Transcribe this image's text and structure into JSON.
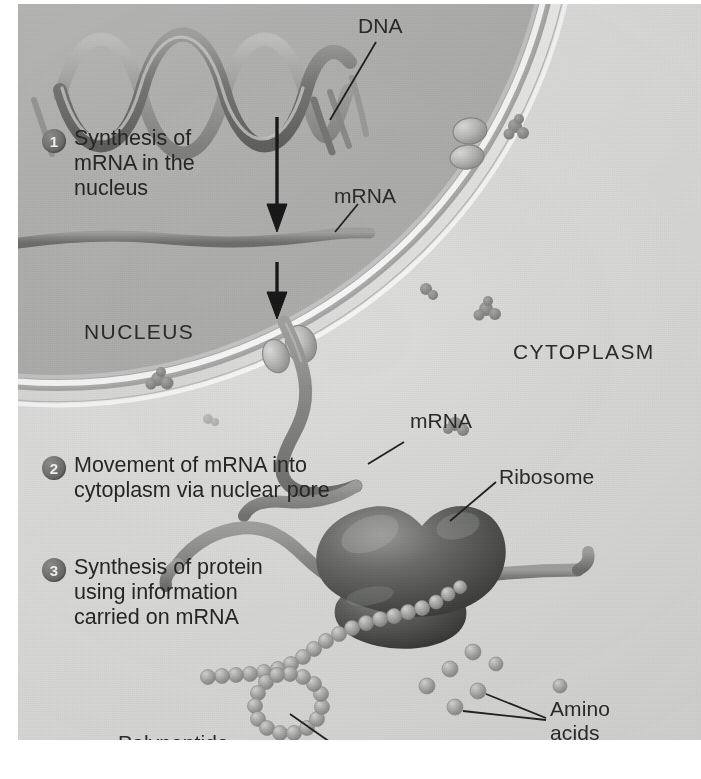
{
  "figure": {
    "background_color": "#d7d8d6",
    "ink_color": "#2a2a2a"
  },
  "regions": [
    {
      "id": "nucleus",
      "label": "NUCLEUS"
    },
    {
      "id": "cytoplasm",
      "label": "CYTOPLASM"
    }
  ],
  "steps": [
    {
      "number": "1",
      "text": "Synthesis of\nmRNA in the\nnucleus"
    },
    {
      "number": "2",
      "text": "Movement of\nmRNA into cytoplasm\nvia nuclear pore"
    },
    {
      "number": "3",
      "text": "Synthesis of\nprotein using\ninformation\ncarried on\nmRNA"
    }
  ],
  "callouts": [
    {
      "id": "dna",
      "label": "DNA"
    },
    {
      "id": "mrna-nuclear",
      "label": "mRNA"
    },
    {
      "id": "mrna-cyto",
      "label": "mRNA"
    },
    {
      "id": "ribosome",
      "label": "Ribosome"
    },
    {
      "id": "amino-acids",
      "label": "Amino\nacids"
    },
    {
      "id": "polypeptide",
      "label": "Polypeptide"
    }
  ],
  "structures": {
    "dna_helix": {
      "name": "DNA double helix ribbon",
      "turns": 4
    },
    "nuclear_envelope": {
      "name": "nuclear envelope double membrane"
    },
    "nuclear_pore": {
      "name": "nuclear pore",
      "count": 2
    },
    "chromatin": {
      "name": "chromatin speck",
      "count": 6
    },
    "mrna_strand": {
      "name": "mRNA ribbon"
    },
    "ribosome": {
      "name": "ribosome large and small subunit"
    },
    "polypeptide": {
      "name": "polypeptide bead chain",
      "bead_count": 34
    },
    "amino_acids": {
      "name": "free amino acid sphere",
      "count": 7
    },
    "arrows": {
      "name": "downward process arrow",
      "count": 2
    }
  },
  "colors": {
    "plate": "#d7d8d6",
    "nucleus_fill": "#b9bab8",
    "cytoplasm_fill": "#dcdddb",
    "membrane": "#f2f3f1",
    "mrna": "#8b8c8a",
    "dna_strand": "#8a8b89",
    "ribosome": "#5a5b59",
    "bead": "#a9aaa8",
    "arrow": "#1c1c1c",
    "step_badge": "#6f706e"
  }
}
